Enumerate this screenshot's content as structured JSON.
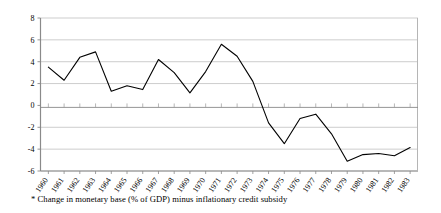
{
  "chart_data": {
    "type": "line",
    "title": "",
    "subtitle": "",
    "xlabel": "",
    "ylabel": "",
    "categories": [
      "1960",
      "1961",
      "1962",
      "1963",
      "1964",
      "1965",
      "1966",
      "1967",
      "1968",
      "1969",
      "1970",
      "1971",
      "1972",
      "1973",
      "1974",
      "1975",
      "1976",
      "1977",
      "1978",
      "1979",
      "1980",
      "1981",
      "1982",
      "1983"
    ],
    "values": [
      3.5,
      2.3,
      4.4,
      4.9,
      1.3,
      1.8,
      1.45,
      4.2,
      3.0,
      1.15,
      3.1,
      5.6,
      4.5,
      2.2,
      -1.6,
      -3.5,
      -1.2,
      -0.8,
      -2.6,
      -5.1,
      -4.5,
      -4.4,
      -4.6,
      -3.85
    ],
    "series": [
      {
        "name": "Change in monetary base (% of GDP) minus inflationary credit subsidy",
        "values": [
          3.5,
          2.3,
          4.4,
          4.9,
          1.3,
          1.8,
          1.45,
          4.2,
          3.0,
          1.15,
          3.1,
          5.6,
          4.5,
          2.2,
          -1.6,
          -3.5,
          -1.2,
          -0.8,
          -2.6,
          -5.1,
          -4.5,
          -4.4,
          -4.6,
          -3.85
        ],
        "color": "#000000"
      }
    ],
    "ylim": [
      -6,
      8
    ],
    "ytick_values": [
      -6,
      -4,
      -2,
      0,
      2,
      4,
      6,
      8
    ],
    "ytick_labels": [
      "-6",
      "-4",
      "-2",
      "0",
      "2",
      "4",
      "6",
      "8"
    ],
    "grid": true,
    "grid_axis": "y",
    "grid_color": "#c0c0c0",
    "legend": false,
    "legend_position": "none",
    "plot_background": "#ffffff",
    "axis_color": "#808080",
    "line_color": "#000000",
    "line_width": 1.1
  },
  "caption": {
    "text": "* Change in monetary base (% of GDP) minus inflationary credit subsidy"
  },
  "axes": {
    "x_label_rotation_degrees": -55
  }
}
